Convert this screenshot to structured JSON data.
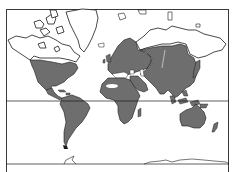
{
  "map": {
    "title": "World distribution range map",
    "projection": "Mercator",
    "colors": {
      "background": "#ffffff",
      "range_fill": "#6e6e6e",
      "land_outline": "#1a1a1a",
      "frame": "#3a3a3a",
      "gap": "#ffffff"
    },
    "regions_shaded": [
      "North America (Canada south to Mexico)",
      "Central America",
      "South America",
      "Europe",
      "Africa",
      "Middle East",
      "Asia (Siberia to Southeast Asia)",
      "Japan",
      "Indonesia",
      "Australia",
      "New Zealand"
    ],
    "regions_unshaded": [
      "Arctic Canada",
      "Greenland",
      "Northern Siberia",
      "Sahara interior",
      "Antarctica"
    ],
    "lines": [
      {
        "name": "equator",
        "y": 101
      },
      {
        "name": "antarctic-boundary",
        "y": 164
      }
    ]
  }
}
